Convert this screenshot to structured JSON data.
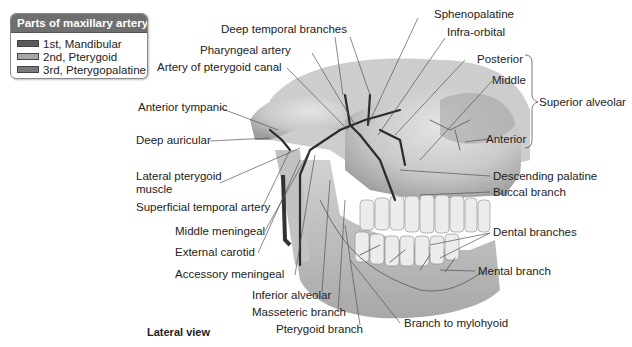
{
  "legend": {
    "title": "Parts of maxillary artery:",
    "items": [
      {
        "label": "1st, Mandibular",
        "color": "#5a5a5a"
      },
      {
        "label": "2nd, Pterygoid",
        "color": "#a8a8a8"
      },
      {
        "label": "3rd, Pterygopalatine",
        "color": "#7a7a7a"
      }
    ]
  },
  "labels": {
    "deep_temporal": "Deep temporal branches",
    "sphenopalatine": "Sphenopalatine",
    "infra_orbital": "Infra-orbital",
    "pharyngeal": "Pharyngeal artery",
    "pterygoid_canal": "Artery of pterygoid canal",
    "posterior": "Posterior",
    "middle": "Middle",
    "superior_alveolar": "Superior alveolar",
    "anterior": "Anterior",
    "anterior_tympanic": "Anterior tympanic",
    "deep_auricular": "Deep auricular",
    "lateral_pterygoid_1": "Lateral pterygoid",
    "lateral_pterygoid_2": "muscle",
    "superficial_temporal": "Superficial temporal artery",
    "middle_meningeal": "Middle meningeal",
    "external_carotid": "External carotid",
    "accessory_meningeal": "Accessory meningeal",
    "inferior_alveolar": "Inferior alveolar",
    "masseteric": "Masseteric branch",
    "pterygoid_branch": "Pterygoid branch",
    "mylohyoid": "Branch to mylohyoid",
    "descending_palatine": "Descending palatine",
    "buccal": "Buccal branch",
    "dental": "Dental branches",
    "mental": "Mental branch"
  },
  "caption": "Lateral view"
}
